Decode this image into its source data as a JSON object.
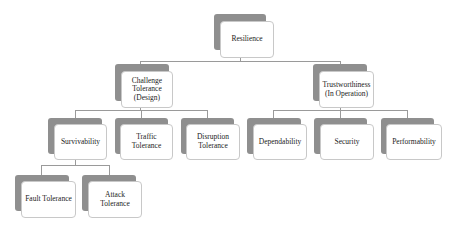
{
  "diagram": {
    "type": "hierarchy",
    "root": {
      "label": "Resilience",
      "children": [
        {
          "label": "Challenge\nTolerance\n(Design)",
          "children": [
            {
              "label": "Survivability",
              "children": [
                {
                  "label": "Fault Tolerance"
                },
                {
                  "label": "Attack\nTolerance"
                }
              ]
            },
            {
              "label": "Traffic\nTolerance"
            },
            {
              "label": "Disruption\nTolerance"
            }
          ]
        },
        {
          "label": "Trustworthiness\n(In Operation)",
          "children": [
            {
              "label": "Dependability"
            },
            {
              "label": "Security"
            },
            {
              "label": "Performability"
            }
          ]
        }
      ]
    }
  },
  "nodes": {
    "resilience": "Resilience",
    "challenge_tolerance": "Challenge\nTolerance\n(Design)",
    "trustworthiness": "Trustworthiness\n(In Operation)",
    "survivability": "Survivability",
    "traffic_tolerance": "Traffic\nTolerance",
    "disruption_tolerance": "Disruption\nTolerance",
    "dependability": "Dependability",
    "security": "Security",
    "performability": "Performability",
    "fault_tolerance": "Fault Tolerance",
    "attack_tolerance": "Attack\nTolerance"
  },
  "colors": {
    "shadow": "#8f8f8f",
    "box_fill": "#ffffff",
    "box_border": "#c8c8c8",
    "connector": "#9a9a9a"
  }
}
